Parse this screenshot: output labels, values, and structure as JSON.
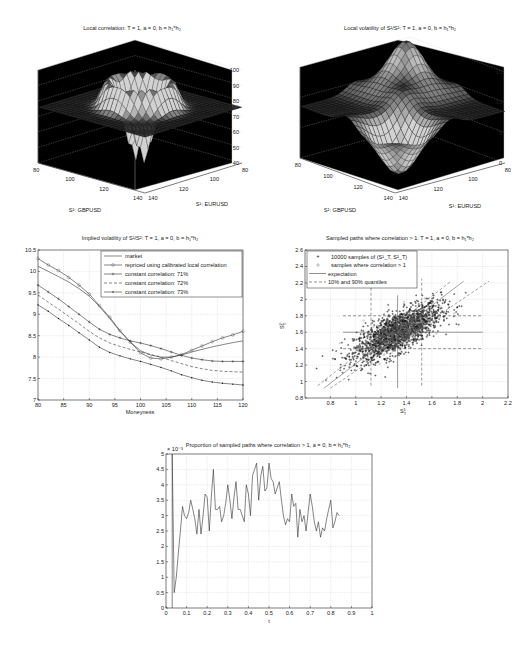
{
  "chart_data": [
    {
      "id": "local-correlation",
      "type": "surface3d",
      "title": "Local correlation: T = 1, a = 0, b = h₁*h₂",
      "xlabel": "S²: GBPUSD",
      "ylabel": "S¹: EURUSD",
      "zlabel": "",
      "x_ticks": [
        "80",
        "100",
        "120",
        "140"
      ],
      "y_ticks": [
        "80",
        "100",
        "120",
        "140"
      ],
      "z_ticks": [
        "40",
        "50",
        "60",
        "70",
        "80",
        "90",
        "100"
      ],
      "zlim": [
        40,
        100
      ],
      "description": "Surface ~75-80 at edges, ridges up to ~95 near 90 and 110, valley down to ~50 in center"
    },
    {
      "id": "local-volatility",
      "type": "surface3d",
      "title": "Local volatility of S¹/S²: T = 1, a = 0, b = h₁*h₂",
      "xlabel": "S²: GBPUSD",
      "ylabel": "S¹: EURUSD",
      "zlabel": "",
      "x_ticks": [
        "80",
        "100",
        "120",
        "140"
      ],
      "y_ticks": [
        "80",
        "100",
        "120",
        "140"
      ],
      "z_ticks": [
        "0",
        "5",
        "10",
        "15"
      ],
      "zlim": [
        0,
        15
      ],
      "description": "Plateau ~8-9, peak ~17 near back corner, dips near 0 at front"
    },
    {
      "id": "implied-volatility",
      "type": "line",
      "title": "Implied volatility of S¹/S²: T = 1, a = 0, b = h₁*h₂",
      "xlabel": "Moneyness",
      "ylabel": "",
      "xlim": [
        80,
        120
      ],
      "ylim": [
        7,
        10.5
      ],
      "x_ticks": [
        "80",
        "85",
        "90",
        "95",
        "100",
        "105",
        "110",
        "115",
        "120"
      ],
      "y_ticks": [
        "7",
        "7.5",
        "8",
        "8.5",
        "9",
        "9.5",
        "10",
        "10.5"
      ],
      "grid": true,
      "legend_position": "top-right",
      "x": [
        80,
        82,
        84,
        86,
        88,
        90,
        92,
        94,
        96,
        98,
        100,
        102,
        104,
        106,
        108,
        110,
        112,
        114,
        116,
        118,
        120
      ],
      "series": [
        {
          "name": "market",
          "style": "solid",
          "marker": "none",
          "values": [
            10.12,
            10.0,
            9.88,
            9.75,
            9.6,
            9.42,
            9.18,
            8.9,
            8.6,
            8.35,
            8.15,
            8.05,
            8.0,
            8.0,
            8.05,
            8.12,
            8.18,
            8.24,
            8.29,
            8.34,
            8.38
          ]
        },
        {
          "name": "repriced using calibrated local correlation",
          "style": "solid",
          "marker": "circle",
          "values": [
            10.3,
            10.15,
            10.02,
            9.86,
            9.68,
            9.47,
            9.2,
            8.93,
            8.62,
            8.35,
            8.1,
            7.98,
            7.96,
            8.0,
            8.06,
            8.16,
            8.26,
            8.36,
            8.45,
            8.52,
            8.6
          ]
        },
        {
          "name": "constant correlation: 71%",
          "style": "solid",
          "marker": "plus",
          "values": [
            9.68,
            9.52,
            9.36,
            9.18,
            9.0,
            8.82,
            8.65,
            8.53,
            8.45,
            8.38,
            8.33,
            8.27,
            8.2,
            8.12,
            8.04,
            7.98,
            7.94,
            7.91,
            7.9,
            7.9,
            7.9
          ]
        },
        {
          "name": "constant correlation: 72%",
          "style": "dashed",
          "marker": "none",
          "values": [
            9.45,
            9.28,
            9.12,
            8.95,
            8.78,
            8.6,
            8.45,
            8.33,
            8.25,
            8.18,
            8.12,
            8.06,
            8.0,
            7.92,
            7.85,
            7.78,
            7.73,
            7.69,
            7.67,
            7.66,
            7.65
          ]
        },
        {
          "name": "constant correlation: 73%",
          "style": "solid",
          "marker": "dot",
          "values": [
            9.22,
            9.07,
            8.9,
            8.74,
            8.57,
            8.4,
            8.23,
            8.11,
            8.03,
            7.96,
            7.9,
            7.83,
            7.76,
            7.68,
            7.59,
            7.52,
            7.46,
            7.42,
            7.39,
            7.37,
            7.35
          ]
        }
      ]
    },
    {
      "id": "sampled-paths",
      "type": "scatter",
      "title": "Sampled paths where correlation > 1: T = 1, a = 0, b = h₁*h₂",
      "xlabel": "S¹_T",
      "ylabel": "S²_T",
      "xlim": [
        0.6,
        2.2
      ],
      "ylim": [
        0.8,
        2.6
      ],
      "x_ticks": [
        "0.8",
        "1",
        "1.2",
        "1.4",
        "1.6",
        "1.8",
        "2",
        "2.2"
      ],
      "y_ticks": [
        "0.8",
        "1",
        "1.2",
        "1.4",
        "1.6",
        "1.8",
        "2",
        "2.2",
        "2.4",
        "2.6"
      ],
      "grid": true,
      "legend_position": "top-left",
      "legend": [
        "10000 samples of (S¹_T, S²_T)",
        "samples where correlation > 1",
        "expectation",
        "10% and 90% quantiles"
      ],
      "n_samples": 10000,
      "expectation": {
        "x": 1.33,
        "y": 1.6
      },
      "quantiles_x": [
        1.12,
        1.52
      ],
      "quantiles_y": [
        1.4,
        1.8
      ],
      "regression_line": {
        "x": [
          0.75,
          1.85
        ],
        "y": [
          0.92,
          2.22
        ]
      },
      "regression_band_upper": {
        "x": [
          0.7,
          1.75
        ],
        "y": [
          0.95,
          2.22
        ]
      },
      "regression_band_lower": {
        "x": [
          0.8,
          2.05
        ],
        "y": [
          0.92,
          2.22
        ]
      },
      "cloud_center": {
        "x": 1.33,
        "y": 1.6
      },
      "cloud_correlation": 0.72
    },
    {
      "id": "proportion-paths",
      "type": "line",
      "title": "Proportion of sampled paths where correlation > 1, a = 0, b = h₁*h₂",
      "xlabel": "t",
      "ylabel": "",
      "y_multiplier": "× 10⁻³",
      "xlim": [
        0,
        1
      ],
      "ylim": [
        0,
        5
      ],
      "x_ticks": [
        "0",
        "0.1",
        "0.2",
        "0.3",
        "0.4",
        "0.5",
        "0.6",
        "0.7",
        "0.8",
        "0.9",
        "1"
      ],
      "y_ticks": [
        "0",
        "0.5",
        "1",
        "1.5",
        "2",
        "2.5",
        "3",
        "3.5",
        "4",
        "4.5",
        "5"
      ],
      "grid": true,
      "x": [
        0.03,
        0.04,
        0.05,
        0.06,
        0.07,
        0.08,
        0.09,
        0.1,
        0.11,
        0.12,
        0.13,
        0.14,
        0.15,
        0.16,
        0.17,
        0.18,
        0.19,
        0.2,
        0.21,
        0.22,
        0.23,
        0.24,
        0.25,
        0.26,
        0.27,
        0.28,
        0.29,
        0.3,
        0.31,
        0.32,
        0.33,
        0.34,
        0.35,
        0.36,
        0.37,
        0.38,
        0.39,
        0.4,
        0.41,
        0.42,
        0.43,
        0.44,
        0.45,
        0.46,
        0.47,
        0.48,
        0.49,
        0.5,
        0.51,
        0.52,
        0.53,
        0.54,
        0.55,
        0.56,
        0.57,
        0.58,
        0.59,
        0.6,
        0.61,
        0.62,
        0.63,
        0.64,
        0.65,
        0.66,
        0.67,
        0.68,
        0.69,
        0.7,
        0.71,
        0.72,
        0.73,
        0.74,
        0.75,
        0.76,
        0.77,
        0.78,
        0.79,
        0.8,
        0.81,
        0.82,
        0.83,
        0.84,
        0.85,
        0.86,
        0.87,
        0.88,
        0.89,
        0.9,
        0.91,
        0.92,
        0.93,
        0.94,
        0.95,
        0.96,
        0.97,
        0.98,
        0.99,
        1.0
      ],
      "values": [
        5.0,
        0.5,
        1.0,
        1.8,
        2.5,
        3.3,
        3.0,
        2.9,
        3.1,
        3.5,
        3.2,
        2.9,
        2.4,
        3.2,
        2.4,
        3.0,
        3.7,
        3.6,
        2.5,
        3.6,
        4.5,
        3.2,
        3.2,
        3.3,
        2.8,
        3.0,
        3.4,
        4.0,
        3.5,
        2.9,
        3.6,
        4.1,
        3.2,
        3.2,
        3.0,
        2.8,
        4.0,
        3.7,
        3.0,
        4.3,
        4.5,
        4.7,
        3.5,
        4.3,
        4.6,
        3.8,
        3.9,
        4.7,
        4.2,
        4.1,
        3.7,
        3.9,
        4.1,
        3.5,
        3.0,
        2.7,
        2.9,
        2.8,
        3.7,
        3.3,
        3.4,
        2.3,
        3.2,
        2.8,
        3.0,
        2.5,
        3.1,
        3.7,
        3.3,
        2.8,
        2.5,
        2.8,
        2.3,
        2.6,
        2.5,
        2.9,
        3.2,
        3.5,
        2.6,
        2.8,
        3.1,
        3.0
      ]
    }
  ]
}
